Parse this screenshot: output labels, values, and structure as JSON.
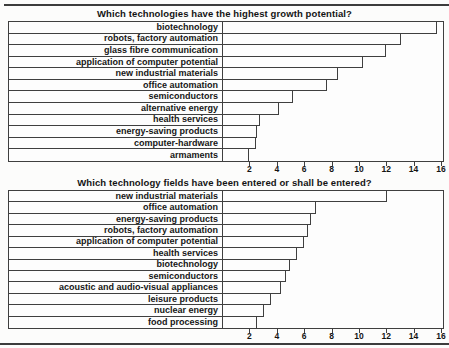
{
  "page": {
    "background_color": "#fcfcfb",
    "line_color": "#3f3f3f"
  },
  "chart_data": [
    {
      "type": "bar",
      "orientation": "horizontal",
      "title": "Which technologies have the highest growth potential?",
      "categories": [
        "biotechnology",
        "robots, factory automation",
        "glass fibre communication",
        "application of computer potential",
        "new industrial materials",
        "office automation",
        "semiconductors",
        "alternative energy",
        "health services",
        "energy-saving products",
        "computer-hardware",
        "armaments"
      ],
      "values": [
        15.6,
        13.0,
        11.9,
        10.2,
        8.4,
        7.6,
        5.1,
        4.1,
        2.7,
        2.5,
        2.4,
        1.9
      ],
      "xlim": [
        0,
        16
      ],
      "xticks": [
        2,
        4,
        6,
        8,
        10,
        12,
        14,
        16
      ],
      "grid": false,
      "bar_fill": "#fdfdfd",
      "bar_border": "#3f3f3f",
      "sort": "descending",
      "legend": null
    },
    {
      "type": "bar",
      "orientation": "horizontal",
      "title": "Which technology fields have been entered or shall be entered?",
      "categories": [
        "new industrial materials",
        "office automation",
        "energy-saving products",
        "robots, factory automation",
        "application of computer potential",
        "health services",
        "biotechnology",
        "semiconductors",
        "acoustic and audio-visual appliances",
        "leisure products",
        "nuclear energy",
        "food processing"
      ],
      "values": [
        12.0,
        6.8,
        6.4,
        6.2,
        5.9,
        5.4,
        4.9,
        4.6,
        4.2,
        3.5,
        3.0,
        2.5
      ],
      "xlim": [
        0,
        16
      ],
      "xticks": [
        2,
        4,
        6,
        8,
        10,
        12,
        14,
        16
      ],
      "grid": false,
      "bar_fill": "#fdfdfd",
      "bar_border": "#3f3f3f",
      "sort": "descending",
      "legend": null
    }
  ]
}
